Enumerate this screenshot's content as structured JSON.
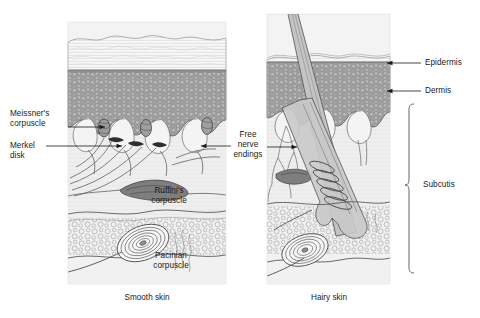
{
  "figure": {
    "panels": [
      {
        "id": "smooth",
        "caption": "Smooth skin"
      },
      {
        "id": "hairy",
        "caption": "Hairy skin"
      }
    ],
    "labels": {
      "meissner": "Meissner's\ncorpuscle",
      "merkel": "Merkel\ndisk",
      "ruffini": "Ruffini's\ncorpuscle",
      "pacinian": "Pacinian\ncorpuscle",
      "free_nerve": "Free\nnerve\nendings",
      "epidermis": "Epidermis",
      "dermis": "Dermis",
      "subcutis": "Subcutis"
    },
    "colors": {
      "ink": "#1a1a1a",
      "line": "#4a4a4a",
      "epidermis_fill": "#9a9a9a",
      "corneum_fill": "#f2f2f2",
      "dermis_fill": "#ececec",
      "subcutis_fill": "#efefef",
      "hair_fill": "#b8b8b8",
      "receptor_fill": "#8c8c8c",
      "background": "#ffffff"
    }
  }
}
